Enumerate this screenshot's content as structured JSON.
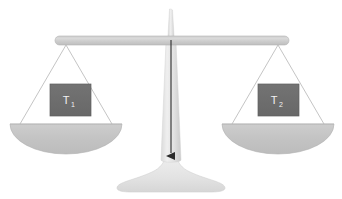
{
  "figure": {
    "name": "balance-scale",
    "background_color": "#ffffff",
    "width": 342,
    "height": 199
  },
  "colors": {
    "beam_light": "#d8d8d8",
    "beam_dark": "#b9b9b9",
    "beam_edge": "#aeaeae",
    "pan": "#c4c4c4",
    "pan_edge": "#b0b0b0",
    "column_light": "#ededed",
    "column_dark": "#cfcfcf",
    "base": "#e4e4e4",
    "block_fill": "#6e6e6e",
    "block_edge": "#5f5f5f",
    "block_text": "#f2f2f2",
    "string": "#bdbdbd",
    "arrow": "#2b2b2b"
  },
  "parts": {
    "beam_label": "balance-beam",
    "pivot_label": "pivot-post",
    "column_label": "support-column",
    "base_label": "base-stand",
    "arrow_label": "downward-arrow"
  },
  "pans": [
    {
      "side": "left",
      "pan_name": "left-pan",
      "string_name": "left-hanger-strings",
      "block": {
        "name": "left-weight-block",
        "symbol": "T",
        "subscript": "1",
        "full_label": "T1"
      }
    },
    {
      "side": "right",
      "pan_name": "right-pan",
      "string_name": "right-hanger-strings",
      "block": {
        "name": "right-weight-block",
        "symbol": "T",
        "subscript": "2",
        "full_label": "T2"
      }
    }
  ]
}
